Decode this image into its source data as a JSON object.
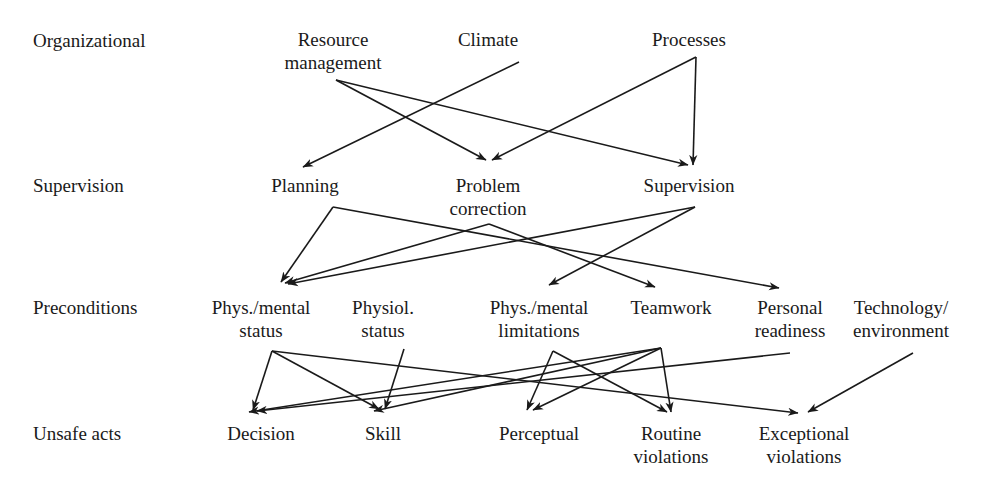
{
  "diagram": {
    "type": "layered-directed-graph",
    "stroke_color": "#1a1a1a",
    "background_color": "#ffffff",
    "tier_labels": [
      {
        "id": "tier-organizational",
        "label": "Organizational",
        "x": 33,
        "y": 30
      },
      {
        "id": "tier-supervision",
        "label": "Supervision",
        "x": 33,
        "y": 175
      },
      {
        "id": "tier-preconditions",
        "label": "Preconditions",
        "x": 33,
        "y": 297
      },
      {
        "id": "tier-unsafe-acts",
        "label": "Unsafe acts",
        "x": 33,
        "y": 423
      }
    ],
    "nodes": [
      {
        "id": "resource-management",
        "tier": "organizational",
        "lines": [
          "Resource",
          "management"
        ],
        "x": 333,
        "y": 29
      },
      {
        "id": "climate",
        "tier": "organizational",
        "lines": [
          "Climate"
        ],
        "x": 488,
        "y": 29
      },
      {
        "id": "processes",
        "tier": "organizational",
        "lines": [
          "Processes"
        ],
        "x": 689,
        "y": 29
      },
      {
        "id": "planning",
        "tier": "supervision",
        "lines": [
          "Planning"
        ],
        "x": 305,
        "y": 175
      },
      {
        "id": "problem-correction",
        "tier": "supervision",
        "lines": [
          "Problem",
          "correction"
        ],
        "x": 488,
        "y": 175
      },
      {
        "id": "supervision-node",
        "tier": "supervision",
        "lines": [
          "Supervision"
        ],
        "x": 689,
        "y": 175
      },
      {
        "id": "phys-mental-status",
        "tier": "preconditions",
        "lines": [
          "Phys./mental",
          "status"
        ],
        "x": 261,
        "y": 297
      },
      {
        "id": "physiol-status",
        "tier": "preconditions",
        "lines": [
          "Physiol.",
          "status"
        ],
        "x": 383,
        "y": 297
      },
      {
        "id": "phys-mental-limitations",
        "tier": "preconditions",
        "lines": [
          "Phys./mental",
          "limitations"
        ],
        "x": 539,
        "y": 297
      },
      {
        "id": "teamwork",
        "tier": "preconditions",
        "lines": [
          "Teamwork"
        ],
        "x": 671,
        "y": 297
      },
      {
        "id": "personal-readiness",
        "tier": "preconditions",
        "lines": [
          "Personal",
          "readiness"
        ],
        "x": 790,
        "y": 297
      },
      {
        "id": "technology-environment",
        "tier": "preconditions",
        "lines": [
          "Technology/",
          "environment"
        ],
        "x": 901,
        "y": 297
      },
      {
        "id": "decision",
        "tier": "unsafe-acts",
        "lines": [
          "Decision"
        ],
        "x": 261,
        "y": 423
      },
      {
        "id": "skill",
        "tier": "unsafe-acts",
        "lines": [
          "Skill"
        ],
        "x": 383,
        "y": 423
      },
      {
        "id": "perceptual",
        "tier": "unsafe-acts",
        "lines": [
          "Perceptual"
        ],
        "x": 539,
        "y": 423
      },
      {
        "id": "routine-violations",
        "tier": "unsafe-acts",
        "lines": [
          "Routine",
          "violations"
        ],
        "x": 671,
        "y": 423
      },
      {
        "id": "exceptional-violations",
        "tier": "unsafe-acts",
        "lines": [
          "Exceptional",
          "violations"
        ],
        "x": 804,
        "y": 423
      }
    ],
    "edges": [
      {
        "id": "e1",
        "from": "resource-management",
        "to": "problem-correction",
        "x1": 336,
        "y1": 80,
        "x2": 486,
        "y2": 160
      },
      {
        "id": "e2",
        "from": "resource-management",
        "to": "supervision-node",
        "x1": 336,
        "y1": 80,
        "x2": 688,
        "y2": 165
      },
      {
        "id": "e3",
        "from": "climate",
        "to": "planning",
        "x1": 519,
        "y1": 62,
        "x2": 303,
        "y2": 167
      },
      {
        "id": "e4",
        "from": "processes",
        "to": "problem-correction",
        "x1": 696,
        "y1": 57,
        "x2": 492,
        "y2": 160
      },
      {
        "id": "e5",
        "from": "processes",
        "to": "supervision-node",
        "x1": 696,
        "y1": 57,
        "x2": 693,
        "y2": 165
      },
      {
        "id": "e6",
        "from": "planning",
        "to": "phys-mental-status",
        "x1": 333,
        "y1": 207,
        "x2": 281,
        "y2": 282
      },
      {
        "id": "e7",
        "from": "planning",
        "to": "personal-readiness",
        "x1": 333,
        "y1": 207,
        "x2": 779,
        "y2": 288
      },
      {
        "id": "e8",
        "from": "problem-correction",
        "to": "phys-mental-status",
        "x1": 489,
        "y1": 224,
        "x2": 285,
        "y2": 283
      },
      {
        "id": "e9",
        "from": "problem-correction",
        "to": "teamwork",
        "x1": 489,
        "y1": 224,
        "x2": 655,
        "y2": 287
      },
      {
        "id": "e10",
        "from": "supervision-node",
        "to": "phys-mental-status",
        "x1": 695,
        "y1": 207,
        "x2": 288,
        "y2": 284
      },
      {
        "id": "e11",
        "from": "supervision-node",
        "to": "phys-mental-limitations",
        "x1": 695,
        "y1": 207,
        "x2": 549,
        "y2": 285
      },
      {
        "id": "e12",
        "from": "phys-mental-status",
        "to": "decision",
        "x1": 272,
        "y1": 351,
        "x2": 253,
        "y2": 410
      },
      {
        "id": "e13",
        "from": "phys-mental-status",
        "to": "skill",
        "x1": 272,
        "y1": 351,
        "x2": 379,
        "y2": 409
      },
      {
        "id": "e14",
        "from": "phys-mental-status",
        "to": "exceptional-violations",
        "x1": 272,
        "y1": 351,
        "x2": 798,
        "y2": 413
      },
      {
        "id": "e15",
        "from": "physiol-status",
        "to": "skill",
        "x1": 404,
        "y1": 349,
        "x2": 385,
        "y2": 409
      },
      {
        "id": "e16",
        "from": "phys-mental-limitations",
        "to": "perceptual",
        "x1": 553,
        "y1": 351,
        "x2": 527,
        "y2": 410
      },
      {
        "id": "e17",
        "from": "phys-mental-limitations",
        "to": "routine-violations",
        "x1": 553,
        "y1": 351,
        "x2": 667,
        "y2": 412
      },
      {
        "id": "e18",
        "from": "teamwork",
        "to": "decision",
        "x1": 661,
        "y1": 348,
        "x2": 249,
        "y2": 412
      },
      {
        "id": "e19",
        "from": "teamwork",
        "to": "skill",
        "x1": 661,
        "y1": 348,
        "x2": 374,
        "y2": 411
      },
      {
        "id": "e20",
        "from": "teamwork",
        "to": "routine-violations",
        "x1": 661,
        "y1": 348,
        "x2": 671,
        "y2": 412
      },
      {
        "id": "e21",
        "from": "teamwork",
        "to": "perceptual",
        "x1": 661,
        "y1": 348,
        "x2": 533,
        "y2": 410
      },
      {
        "id": "e22",
        "from": "personal-readiness",
        "to": "decision",
        "x1": 790,
        "y1": 353,
        "x2": 257,
        "y2": 411
      },
      {
        "id": "e23",
        "from": "technology-environment",
        "to": "exceptional-violations",
        "x1": 913,
        "y1": 353,
        "x2": 808,
        "y2": 412
      }
    ]
  }
}
